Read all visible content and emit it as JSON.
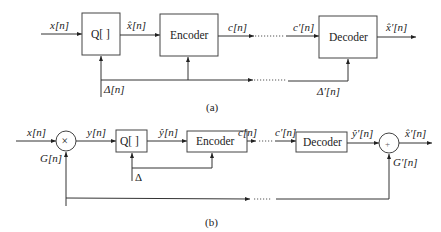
{
  "diagram_a": {
    "caption": "(a)",
    "input_label": "x[n]",
    "quantizer_label": "Q[  ]",
    "quantized_label": "x̂[n]",
    "encoder_label": "Encoder",
    "code_label": "c[n]",
    "received_code_label": "c′[n]",
    "decoder_label": "Decoder",
    "output_label": "x̂′[n]",
    "step_label": "Δ[n]",
    "received_step_label": "Δ′[n]"
  },
  "diagram_b": {
    "caption": "(b)",
    "input_label": "x[n]",
    "multiplier_symbol": "×",
    "gain_label": "G[n]",
    "scaled_label": "y[n]",
    "quantizer_label": "Q[  ]",
    "quantized_label": "ŷ[n]",
    "encoder_label": "Encoder",
    "code_label": "c[n]",
    "received_code_label": "c′[n]",
    "decoder_label": "Decoder",
    "decoded_label": "ŷ′[n]",
    "adder_symbol": "+",
    "received_gain_label": "G′[n]",
    "output_label": "x̂′[n]",
    "step_label": "Δ"
  }
}
